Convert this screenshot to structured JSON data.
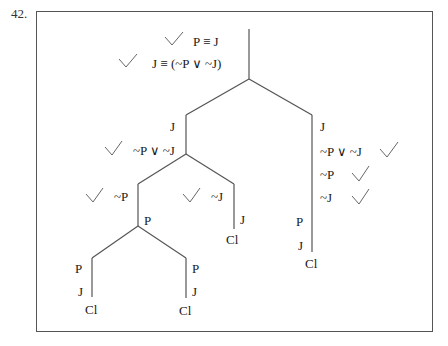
{
  "problem": {
    "number": "42."
  },
  "premises": [
    {
      "formula": "P ≡ J",
      "checked": true
    },
    {
      "formula": "J ≡ (~P ∨ ~J)",
      "checked": true
    }
  ],
  "tree": {
    "left_branch": {
      "lines": [
        {
          "formula": "J"
        },
        {
          "formula": "~P ∨ ~J",
          "checked": true
        }
      ],
      "left_sub": {
        "lines": [
          {
            "formula": "~P",
            "checked": true
          },
          {
            "formula": "P"
          }
        ],
        "left_leaf": {
          "lines": [
            "P",
            "J"
          ],
          "close": "Cl"
        },
        "right_leaf": {
          "lines": [
            "P",
            "J"
          ],
          "close": "Cl"
        }
      },
      "right_sub": {
        "lines": [
          {
            "formula": "~J",
            "checked": true
          },
          {
            "formula": "J"
          }
        ],
        "close": "Cl"
      }
    },
    "right_branch": {
      "lines": [
        {
          "formula": "J"
        },
        {
          "formula": "~P ∨ ~J",
          "checked": true
        },
        {
          "formula": "~P",
          "checked": true
        },
        {
          "formula": "~J",
          "checked": true
        },
        {
          "formula": "P"
        },
        {
          "formula": "J"
        }
      ],
      "close": "Cl"
    }
  },
  "colors": {
    "line": "#555555",
    "check": "#666666",
    "text": "#1a1a1a"
  }
}
